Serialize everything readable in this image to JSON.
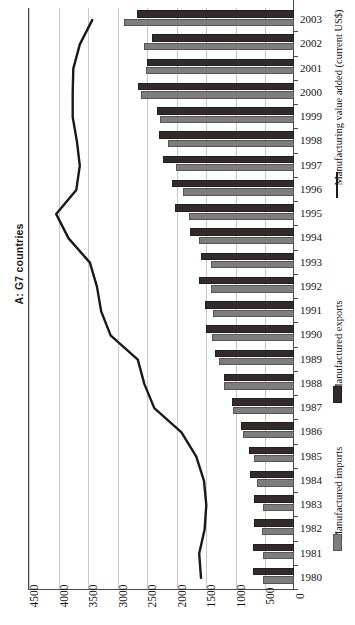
{
  "chart_data": {
    "type": "bar",
    "title": "A: G7 countries",
    "orientation": "horizontal",
    "xlabel": "",
    "ylabel": "",
    "xlim": [
      0,
      4500
    ],
    "xticks": [
      4500,
      4000,
      3500,
      3000,
      2500,
      2000,
      1500,
      1000,
      500,
      0
    ],
    "xtick_labels": [
      "4500",
      "4000",
      "3500",
      "3000",
      "2500",
      "2000",
      "1500",
      "1000",
      "500",
      "0"
    ],
    "x_axis_direction": "reversed (0 at right, 4500 at left)",
    "grid": true,
    "legend_position": "right",
    "categories": [
      "2003",
      "2002",
      "2001",
      "2000",
      "1999",
      "1998",
      "1997",
      "1996",
      "1995",
      "1994",
      "1993",
      "1992",
      "1991",
      "1990",
      "1989",
      "1988",
      "1987",
      "1986",
      "1985",
      "1984",
      "1983",
      "1982",
      "1981",
      "1980"
    ],
    "series": [
      {
        "name": "Manufactured exports",
        "type": "bar",
        "color": "#332b2b",
        "values": [
          2650,
          2400,
          2480,
          2640,
          2310,
          2290,
          2210,
          2060,
          2020,
          1760,
          1580,
          1600,
          1500,
          1490,
          1330,
          1190,
          1050,
          900,
          760,
          740,
          670,
          680,
          690,
          700
        ]
      },
      {
        "name": "Manufactured imports",
        "type": "bar",
        "color": "#7d7d7d",
        "values": [
          2870,
          2540,
          2500,
          2590,
          2270,
          2130,
          1990,
          1870,
          1770,
          1600,
          1400,
          1410,
          1370,
          1380,
          1270,
          1180,
          1040,
          860,
          680,
          620,
          530,
          550,
          530,
          520
        ]
      },
      {
        "name": "Manufacturing value added (current US$)",
        "type": "line",
        "color": "#1a1a1a",
        "values": [
          3430,
          3640,
          3750,
          3760,
          3760,
          3690,
          3640,
          3700,
          4040,
          3830,
          3470,
          3350,
          3280,
          3120,
          2660,
          2550,
          2380,
          1920,
          1670,
          1540,
          1500,
          1530,
          1620,
          1590
        ]
      }
    ],
    "legend": [
      {
        "label": "Manufacturing value added (current US$)",
        "marker": "line",
        "color": "#1a1a1a"
      },
      {
        "label": "Manufactured exports",
        "marker": "square",
        "color": "#332b2b"
      },
      {
        "label": "Manufactured imports",
        "marker": "square",
        "color": "#7d7d7d"
      }
    ]
  }
}
